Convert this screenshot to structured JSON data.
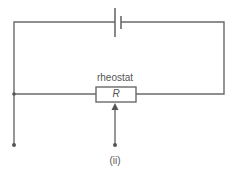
{
  "diagram": {
    "components": {
      "cell": {
        "label": ""
      },
      "rheostat": {
        "label": "rheostat",
        "symbol": "R"
      }
    },
    "caption": "(ii)",
    "terminals": 2,
    "colors": {
      "wire": "#6a6a6a",
      "text": "#555555",
      "background": "#ffffff"
    }
  }
}
